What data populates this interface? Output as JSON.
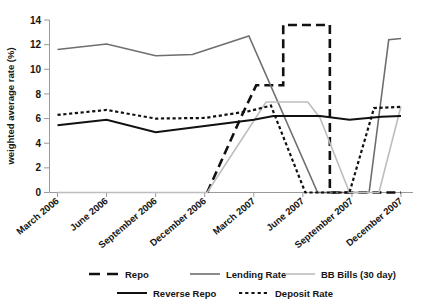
{
  "chart_data": {
    "type": "line",
    "title": "",
    "xlabel": "",
    "ylabel": "weighted average rate (%)",
    "ylim": [
      0,
      14
    ],
    "yticks": [
      0,
      2,
      4,
      6,
      8,
      10,
      12,
      14
    ],
    "ytick_labels": [
      "0",
      "2",
      "4",
      "6",
      "8",
      "10",
      "12",
      "14"
    ],
    "grid": false,
    "legend_position": "bottom",
    "categories": [
      "March 2006",
      "June 2006",
      "September 2006",
      "December 2006",
      "March 2007",
      "June 2007",
      "September 2007",
      "December 2007"
    ],
    "x": [
      0,
      1,
      2,
      3,
      4,
      5,
      6,
      7
    ],
    "series": [
      {
        "name": "Repo",
        "style": "long-dash",
        "color": "#111111",
        "width": 2.6,
        "points": [
          [
            3.05,
            0.0
          ],
          [
            3.75,
            6.2
          ],
          [
            4.05,
            8.7
          ],
          [
            4.6,
            8.7
          ],
          [
            4.6,
            13.6
          ],
          [
            5.55,
            13.6
          ],
          [
            5.55,
            0.0
          ],
          [
            6.35,
            0.0
          ],
          [
            7.0,
            0.0
          ]
        ],
        "note": "flat at 0 through 2006, spikes from December 2006, vertical jumps to 13.6 between June and September 2007, back to 0 after"
      },
      {
        "name": "Lending Rate",
        "style": "solid",
        "color": "#6e6e6e",
        "width": 1.6,
        "values": [
          11.6,
          12.05,
          11.1,
          11.25,
          12.7,
          0.0,
          0.0,
          12.5
        ],
        "points": [
          [
            0.0,
            11.6
          ],
          [
            1.0,
            12.05
          ],
          [
            2.0,
            11.1
          ],
          [
            2.75,
            11.2
          ],
          [
            3.9,
            12.7
          ],
          [
            5.3,
            0.0
          ],
          [
            6.35,
            0.0
          ],
          [
            6.75,
            12.4
          ],
          [
            7.0,
            12.5
          ]
        ]
      },
      {
        "name": "BB Bills (30 day)",
        "style": "solid",
        "color": "#bdbdbd",
        "width": 1.6,
        "points": [
          [
            0.0,
            0.0
          ],
          [
            3.05,
            0.0
          ],
          [
            4.25,
            7.35
          ],
          [
            5.1,
            7.35
          ],
          [
            5.35,
            6.05
          ],
          [
            5.95,
            0.0
          ],
          [
            6.55,
            0.0
          ],
          [
            7.0,
            7.0
          ]
        ]
      },
      {
        "name": "Reverse Repo",
        "style": "solid",
        "color": "#111111",
        "width": 2.0,
        "values": [
          5.45,
          5.9,
          4.9,
          5.4,
          5.85,
          6.2,
          5.95,
          6.2
        ],
        "points": [
          [
            0.0,
            5.45
          ],
          [
            1.0,
            5.9
          ],
          [
            2.0,
            4.9
          ],
          [
            3.0,
            5.4
          ],
          [
            4.0,
            5.9
          ],
          [
            4.4,
            6.2
          ],
          [
            5.35,
            6.2
          ],
          [
            5.95,
            5.9
          ],
          [
            6.6,
            6.15
          ],
          [
            7.0,
            6.2
          ]
        ]
      },
      {
        "name": "Deposit Rate",
        "style": "dotted",
        "color": "#111111",
        "width": 2.2,
        "values": [
          6.3,
          6.7,
          6.0,
          6.05,
          6.6,
          0.0,
          0.0,
          6.95
        ],
        "points": [
          [
            0.0,
            6.3
          ],
          [
            1.0,
            6.7
          ],
          [
            2.0,
            6.0
          ],
          [
            3.0,
            6.05
          ],
          [
            3.9,
            6.6
          ],
          [
            4.35,
            7.05
          ],
          [
            5.05,
            0.0
          ],
          [
            5.95,
            0.0
          ],
          [
            6.45,
            6.85
          ],
          [
            7.0,
            6.95
          ]
        ]
      }
    ],
    "legend": [
      {
        "label": "Repo",
        "style": "long-dash",
        "color": "#111111"
      },
      {
        "label": "Lending Rate",
        "style": "solid",
        "color": "#6e6e6e"
      },
      {
        "label": "BB Bills (30 day)",
        "style": "solid",
        "color": "#bdbdbd"
      },
      {
        "label": "Reverse Repo",
        "style": "solid",
        "color": "#111111"
      },
      {
        "label": "Deposit Rate",
        "style": "dotted",
        "color": "#111111"
      }
    ]
  },
  "axis": {
    "y_title": "weighted average rate (%)",
    "y_ticks": [
      "14",
      "12",
      "10",
      "8",
      "6",
      "4",
      "2",
      "0"
    ],
    "x_ticks": [
      "March 2006",
      "June 2006",
      "September 2006",
      "December 2006",
      "March 2007",
      "June 2007",
      "September 2007",
      "December 2007"
    ]
  },
  "legend": {
    "row1": [
      {
        "label": "Repo"
      },
      {
        "label": "Lending Rate"
      },
      {
        "label": "BB Bills (30 day)"
      }
    ],
    "row2": [
      {
        "label": "Reverse Repo"
      },
      {
        "label": "Deposit Rate"
      }
    ]
  },
  "colors": {
    "repo": "#111111",
    "lending_rate": "#6e6e6e",
    "bb_bills": "#bdbdbd",
    "reverse_repo": "#111111",
    "deposit_rate": "#111111",
    "axis": "#9a9a9a",
    "text": "#141414",
    "background": "#ffffff"
  }
}
